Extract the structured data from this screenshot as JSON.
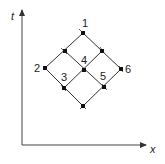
{
  "diagram": {
    "axes": {
      "vertical_label": "t",
      "horizontal_label": "x"
    },
    "nodes": [
      {
        "id": "top",
        "x": 83,
        "y": 33,
        "label": "1"
      },
      {
        "id": "upper-left",
        "x": 65,
        "y": 51,
        "label": ""
      },
      {
        "id": "upper-right",
        "x": 102,
        "y": 51,
        "label": ""
      },
      {
        "id": "left",
        "x": 45,
        "y": 68,
        "label": "2"
      },
      {
        "id": "center",
        "x": 84,
        "y": 70,
        "label": "4"
      },
      {
        "id": "right",
        "x": 121,
        "y": 69,
        "label": "6"
      },
      {
        "id": "lower-left",
        "x": 64,
        "y": 88,
        "label": ""
      },
      {
        "id": "lower-right",
        "x": 104,
        "y": 87,
        "label": ""
      },
      {
        "id": "bottom",
        "x": 83,
        "y": 106,
        "label": ""
      }
    ],
    "region_labels": [
      {
        "text": "3",
        "x": 60,
        "y": 73
      },
      {
        "text": "5",
        "x": 100,
        "y": 73
      }
    ],
    "line_color": "#333333",
    "node_color": "#111111"
  }
}
